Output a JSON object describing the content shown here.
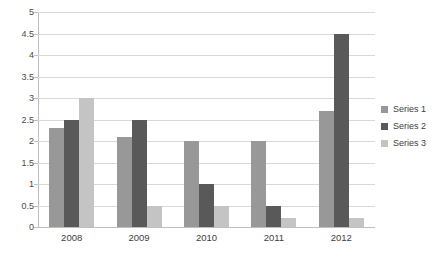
{
  "chart_data": {
    "type": "bar",
    "title": "",
    "subtitle": "",
    "xlabel": "",
    "ylabel": "",
    "categories": [
      "2008",
      "2009",
      "2010",
      "2011",
      "2012"
    ],
    "series": [
      {
        "name": "Series 1",
        "color": "#989898",
        "values": [
          2.3,
          2.1,
          2.0,
          2.0,
          2.7
        ]
      },
      {
        "name": "Series 2",
        "color": "#595959",
        "values": [
          2.5,
          2.5,
          1.0,
          0.5,
          4.5
        ]
      },
      {
        "name": "Series 3",
        "color": "#c4c4c4",
        "values": [
          3.0,
          0.5,
          0.5,
          0.2,
          0.2
        ]
      }
    ],
    "ylim": [
      0,
      5
    ],
    "ytick_labels": [
      "0",
      "0.5",
      "1",
      "1.5",
      "2",
      "2.5",
      "3",
      "3.5",
      "4",
      "4.5",
      "5"
    ],
    "ytick_values": [
      0,
      0.5,
      1,
      1.5,
      2,
      2.5,
      3,
      3.5,
      4,
      4.5,
      5
    ],
    "grid": true,
    "grid_axis": "y",
    "legend_position": "right",
    "background_color": "#ffffff",
    "gridline_color": "#d9d9d9",
    "axis_color": "#bfbfbf",
    "text_color": "#3d3d3d"
  }
}
